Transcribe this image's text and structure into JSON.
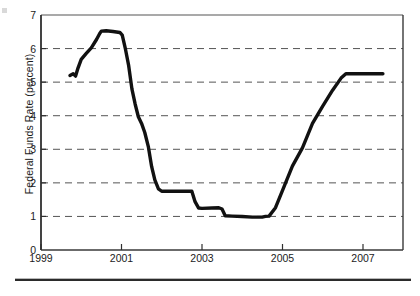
{
  "figure": {
    "background_color": "#ffffff",
    "ink_color": "#1a1a1a",
    "gridline_color": "#555555",
    "axis_color": "#3a3a3a",
    "series_color": "#111111"
  },
  "axes": {
    "y_title": "Federal Funds Rate (percent)",
    "y_ticks": [
      "0",
      "1",
      "2",
      "3",
      "4",
      "5",
      "6",
      "7"
    ],
    "x_ticks": [
      "1999",
      "2001",
      "2003",
      "2005",
      "2007"
    ]
  },
  "footer": {
    "rule_label": "horizontal-rule"
  },
  "chart_data": {
    "type": "line",
    "title": "",
    "xlabel": "",
    "ylabel": "Federal Funds Rate (percent)",
    "xlim": [
      1999,
      2008
    ],
    "ylim": [
      0,
      7
    ],
    "ytick_values": [
      0,
      1,
      2,
      3,
      4,
      5,
      6,
      7
    ],
    "xtick_values": [
      1999,
      2001,
      2003,
      2005,
      2007
    ],
    "grid": "horizontal-dashed",
    "grid_at": [
      1,
      2,
      3,
      4,
      5,
      6
    ],
    "legend": "none",
    "series": [
      {
        "name": "Federal Funds Rate",
        "color": "#111111",
        "x": [
          1999.72,
          1999.8,
          1999.86,
          1999.92,
          2000.0,
          2000.12,
          2000.25,
          2000.38,
          2000.46,
          2000.5,
          2000.62,
          2000.79,
          2000.96,
          2001.02,
          2001.1,
          2001.18,
          2001.26,
          2001.34,
          2001.42,
          2001.5,
          2001.58,
          2001.67,
          2001.75,
          2001.83,
          2001.92,
          2002.0,
          2002.25,
          2002.5,
          2002.75,
          2002.83,
          2002.92,
          2003.0,
          2003.25,
          2003.42,
          2003.5,
          2003.58,
          2003.75,
          2004.0,
          2004.25,
          2004.5,
          2004.58,
          2004.67,
          2004.83,
          2005.0,
          2005.25,
          2005.5,
          2005.75,
          2006.0,
          2006.25,
          2006.46,
          2006.58,
          2006.75,
          2007.0,
          2007.25,
          2007.5
        ],
        "y": [
          5.2,
          5.25,
          5.18,
          5.42,
          5.68,
          5.85,
          6.02,
          6.27,
          6.45,
          6.52,
          6.53,
          6.51,
          6.48,
          6.4,
          5.98,
          5.49,
          4.8,
          4.35,
          3.97,
          3.77,
          3.5,
          3.07,
          2.49,
          2.09,
          1.82,
          1.75,
          1.75,
          1.75,
          1.75,
          1.44,
          1.25,
          1.24,
          1.25,
          1.26,
          1.22,
          1.02,
          1.01,
          1.0,
          0.98,
          0.98,
          1.0,
          1.01,
          1.26,
          1.76,
          2.5,
          3.04,
          3.77,
          4.28,
          4.76,
          5.12,
          5.25,
          5.25,
          5.25,
          5.25,
          5.25
        ]
      }
    ],
    "annotations": []
  }
}
